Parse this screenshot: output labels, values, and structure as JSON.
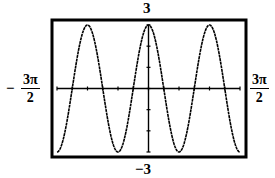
{
  "chart_data": {
    "type": "line",
    "title": "",
    "function": "y = 3cos(2x)",
    "xlabel": "",
    "ylabel": "",
    "xlim_labels": {
      "min": "−3π/2",
      "max": "3π/2"
    },
    "xlim": [
      -4.712,
      4.712
    ],
    "ylim": [
      -3,
      3
    ],
    "ylim_labels": {
      "max": "3",
      "min": "−3"
    },
    "x_tick_step": "π/4",
    "y_tick_step": 1,
    "grid": false,
    "legend": null,
    "series": [
      {
        "name": "y = 3cos(2x)",
        "x": [
          -4.712,
          -3.927,
          -3.142,
          -2.356,
          -1.571,
          -0.785,
          0,
          0.785,
          1.571,
          2.356,
          3.142,
          3.927,
          4.712
        ],
        "values": [
          -3,
          0,
          3,
          0,
          -3,
          0,
          3,
          0,
          -3,
          0,
          3,
          0,
          -3
        ]
      }
    ]
  },
  "labels": {
    "ymax": "3",
    "ymin": "−3",
    "xmin_sign": "−",
    "xmin_num": "3π",
    "xmin_den": "2",
    "xmax_num": "3π",
    "xmax_den": "2"
  },
  "style": {
    "frame_color": "#000000",
    "curve_color": "#000000",
    "background": "#ffffff"
  }
}
